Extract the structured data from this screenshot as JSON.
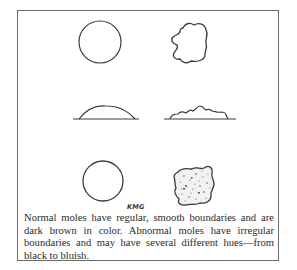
{
  "figure": {
    "signature": "KMG",
    "caption": "Normal moles have regular, smooth boundaries and are dark brown in color. Abnormal moles have irregular boundaries and may have several different hues—from black to bluish.",
    "panels": [
      {
        "row": "top-view",
        "normal": "regular-circle",
        "abnormal": "irregular-blob"
      },
      {
        "row": "side-view",
        "normal": "smooth-dome",
        "abnormal": "irregular-raised"
      },
      {
        "row": "color-view",
        "normal": "regular-circle",
        "abnormal": "speckled-irregular-blob"
      }
    ],
    "colors": {
      "line": "#3a3a3a",
      "border": "#6a6a6a",
      "text": "#2a2a2a"
    }
  }
}
